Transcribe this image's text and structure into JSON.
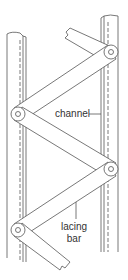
{
  "diagram": {
    "labels": {
      "channel": "channel",
      "lacing_line1": "lacing",
      "lacing_line2": "bar"
    },
    "colors": {
      "stroke": "#555555",
      "text": "#333333",
      "background": "#ffffff"
    }
  }
}
